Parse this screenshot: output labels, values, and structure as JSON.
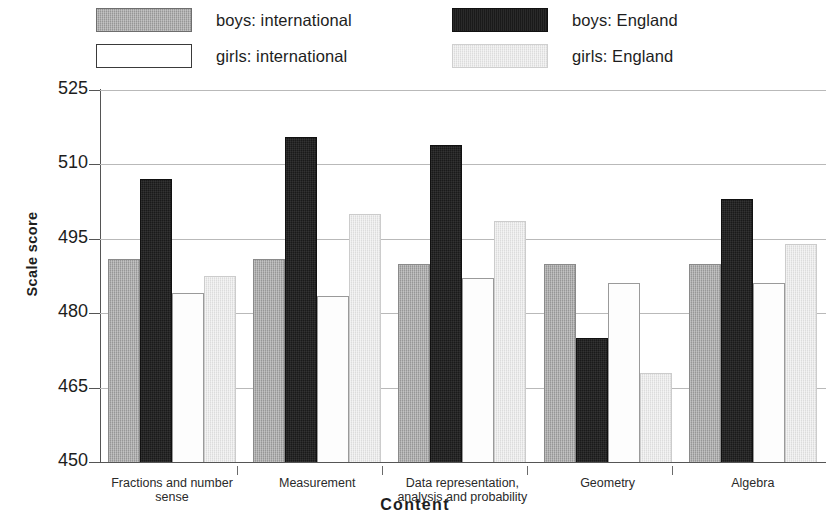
{
  "legend": {
    "items": [
      {
        "key": "boys_international",
        "label": "boys: international",
        "swatch": "medium-gray-hatched",
        "color": "#969696"
      },
      {
        "key": "boys_england",
        "label": "boys: England",
        "swatch": "black",
        "color": "#1a1a1a"
      },
      {
        "key": "girls_international",
        "label": "girls: international",
        "swatch": "white-outlined",
        "color": "#ffffff"
      },
      {
        "key": "girls_england",
        "label": "girls: England",
        "swatch": "light-gray-hatched",
        "color": "#dcdcdc"
      }
    ]
  },
  "axes": {
    "y_title": "Scale score",
    "x_title": "Content",
    "y_ticks": [
      "525",
      "510",
      "495",
      "480",
      "465",
      "450"
    ]
  },
  "chart_data": {
    "type": "bar",
    "title": "",
    "xlabel": "Content",
    "ylabel": "Scale score",
    "ylim": [
      450,
      525
    ],
    "ytick_values": [
      450,
      465,
      480,
      495,
      510,
      525
    ],
    "grid": true,
    "legend_position": "top",
    "categories": [
      "Fractions and number sense",
      "Measurement",
      "Data representation, analysis and probability",
      "Geometry",
      "Algebra"
    ],
    "category_labels_wrapped": [
      [
        "Fractions and number",
        "sense"
      ],
      [
        "Measurement"
      ],
      [
        "Data representation,",
        "analysis and probability"
      ],
      [
        "Geometry"
      ],
      [
        "Algebra"
      ]
    ],
    "series": [
      {
        "name": "boys: international",
        "color": "#969696",
        "values": [
          491,
          491,
          490,
          490,
          490
        ]
      },
      {
        "name": "boys: England",
        "color": "#1a1a1a",
        "values": [
          507,
          515.5,
          514,
          475,
          503
        ]
      },
      {
        "name": "girls: international",
        "color": "#ffffff",
        "values": [
          484,
          483.5,
          487,
          486,
          486
        ]
      },
      {
        "name": "girls: England",
        "color": "#dcdcdc",
        "values": [
          487.5,
          500,
          498.5,
          468,
          494
        ]
      }
    ]
  }
}
